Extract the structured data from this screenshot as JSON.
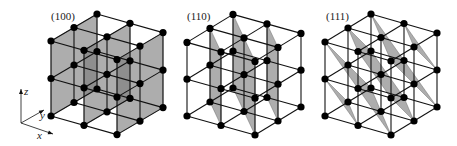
{
  "figure": {
    "background": "#ffffff",
    "line_color": "#111111",
    "node_color": "#000000",
    "plane_fill": "#7a7a7a",
    "plane_opacity": 0.62,
    "node_radius": 3.6,
    "lattice_size": 3
  },
  "axes": {
    "origin": [
      21,
      123
    ],
    "z": {
      "label": "z",
      "tip": [
        21,
        89
      ],
      "label_pos": [
        24,
        95
      ]
    },
    "y": {
      "label": "y",
      "tip": [
        44,
        110
      ],
      "label_pos": [
        40,
        119
      ]
    },
    "x": {
      "label": "x",
      "tip": [
        53,
        134
      ],
      "label_pos": [
        37,
        139
      ]
    }
  },
  "cubes": [
    {
      "name": "cube-100",
      "label": "(100)",
      "label_pos": [
        51,
        20
      ],
      "origin": [
        51,
        116
      ],
      "ex": [
        33,
        9.3
      ],
      "ey": [
        23,
        -13.5
      ],
      "ez": [
        0,
        -37.5
      ],
      "miller": [
        1,
        0,
        0
      ]
    },
    {
      "name": "cube-110",
      "label": "(110)",
      "label_pos": [
        187,
        20
      ],
      "origin": [
        187,
        116
      ],
      "ex": [
        34,
        9.5
      ],
      "ey": [
        23,
        -14
      ],
      "ez": [
        0,
        -36.8
      ],
      "miller": [
        1,
        1,
        0
      ]
    },
    {
      "name": "cube-111",
      "label": "(111)",
      "label_pos": [
        326,
        20
      ],
      "origin": [
        325,
        116
      ],
      "ex": [
        33,
        9.5
      ],
      "ey": [
        23,
        -14
      ],
      "ez": [
        0,
        -37
      ],
      "miller": [
        1,
        1,
        1
      ]
    }
  ]
}
